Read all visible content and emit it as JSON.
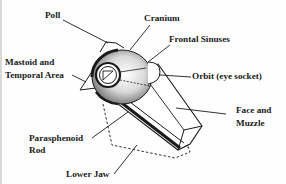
{
  "diagram": {
    "colors": {
      "ink": "#1a1a1a",
      "shade": "#6e6e6e",
      "background": "#fefefe",
      "border": "#d8d8d8"
    },
    "labels": {
      "poll": "Poll",
      "cranium": "Cranium",
      "frontal_sinuses": "Frontal Sinuses",
      "mastoid_line1": "Mastoid and",
      "mastoid_line2": "Temporal Area",
      "orbit": "Orbit (eye socket)",
      "face_line1": "Face and",
      "face_line2": "Muzzle",
      "parasphenoid_line1": "Parasphenoid",
      "parasphenoid_line2": "Rod",
      "lower_jaw": "Lower Jaw"
    }
  }
}
